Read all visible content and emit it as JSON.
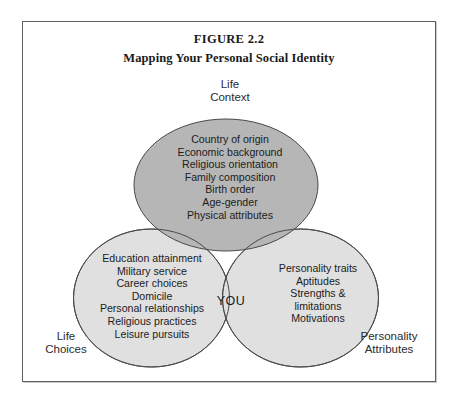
{
  "figure": {
    "number": "FIGURE 2.2",
    "title": "Mapping Your Personal Social Identity"
  },
  "colors": {
    "frame_border": "#5b5f63",
    "top_circle_fill": "#b6b6b6",
    "lower_circle_fill": "#e0e0e0",
    "circle_stroke": "#4a4a4a",
    "text": "#1c1c1c",
    "page_background": "#ffffff"
  },
  "outer_labels": {
    "life_context": "Life\nContext",
    "life_choices": "Life\nChoices",
    "personality_attributes": "Personality\nAttributes"
  },
  "center_label": "YOU",
  "chart_data": {
    "type": "diagram",
    "diagram_type": "venn",
    "title": "Mapping Your Personal Social Identity",
    "subtitle": "FIGURE 2.2",
    "set_count": 3,
    "intersection_label": "YOU",
    "sets": [
      {
        "name": "Life Context",
        "position": "top",
        "fill": "#b6b6b6",
        "items": [
          "Country of origin",
          "Economic background",
          "Religious orientation",
          "Family composition",
          "Birth order",
          "Age-gender",
          "Physical attributes"
        ]
      },
      {
        "name": "Life Choices",
        "position": "bottom-left",
        "fill": "#e0e0e0",
        "items": [
          "Education attainment",
          "Military service",
          "Career choices",
          "Domicile",
          "Personal relationships",
          "Religious practices",
          "Leisure pursuits"
        ]
      },
      {
        "name": "Personality Attributes",
        "position": "bottom-right",
        "fill": "#e0e0e0",
        "items": [
          "Personality traits",
          "Aptitudes",
          "Strengths &",
          "limitations",
          "Motivations"
        ]
      }
    ]
  }
}
